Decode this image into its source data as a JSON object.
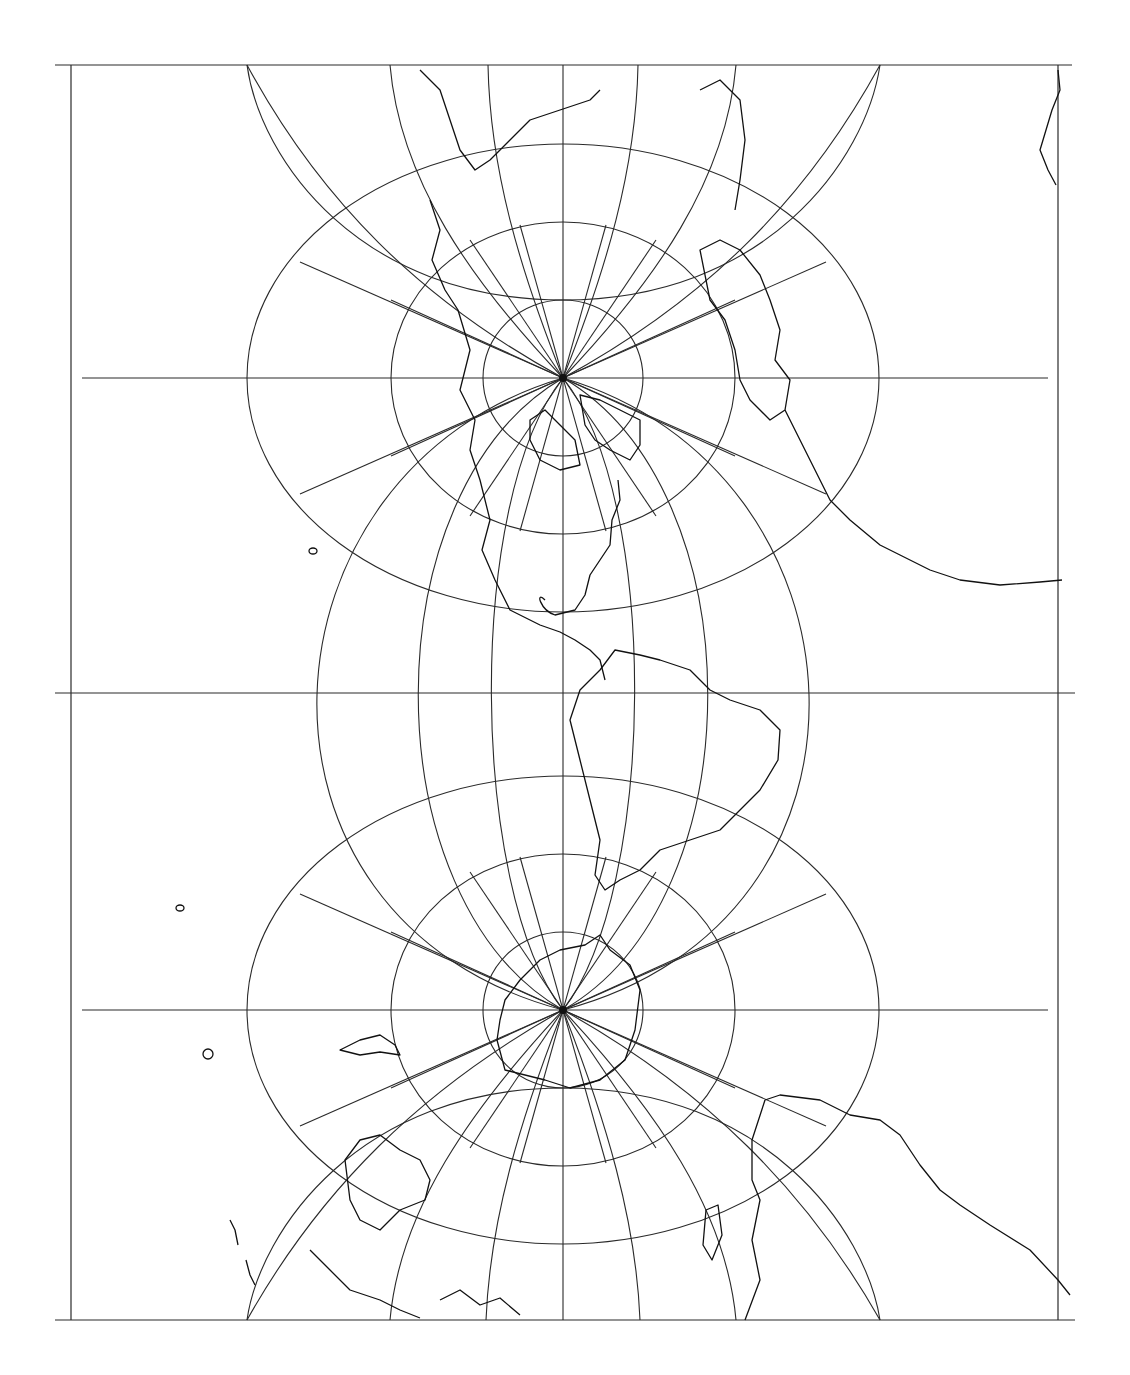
{
  "map": {
    "title": "Transverse/oblique world projection with graticule",
    "caption": "",
    "colors": {
      "background": "#ffffff",
      "graticule": "#2a2a2a",
      "coastline": "#111111"
    },
    "frame": {
      "left": 71,
      "right": 1058,
      "top": 65,
      "bottom": 1320
    },
    "poles": [
      {
        "name": "north-pole",
        "cx": 563,
        "cy": 378
      },
      {
        "name": "south-pole",
        "cx": 563,
        "cy": 1010
      }
    ],
    "horizontal_lines_y": [
      378,
      693,
      1010
    ],
    "central_meridian_x": 563,
    "features": [
      "north-america",
      "south-america",
      "greenland",
      "europe",
      "africa",
      "antarctica",
      "australia",
      "southeast-asia",
      "pacific-islands"
    ]
  }
}
